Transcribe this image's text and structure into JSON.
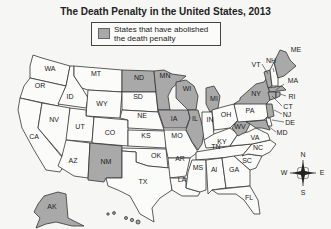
{
  "title": "The Death Penalty in the United States, 2013",
  "legend": {
    "label": "States that have abolished the death penalty",
    "swatch_color": "#a9a9a9"
  },
  "colors": {
    "abolished": "#a9a9a9",
    "retained": "#fbfbfa",
    "border": "#333333"
  },
  "abolished_states": [
    "ND",
    "MN",
    "WI",
    "MI",
    "IA",
    "IL",
    "NM",
    "NY",
    "VT",
    "ME",
    "MA",
    "RI",
    "CT",
    "NJ",
    "WV",
    "MD",
    "AK",
    "HI"
  ],
  "state_labels": {
    "WA": "WA",
    "OR": "OR",
    "CA": "CA",
    "ID": "ID",
    "NV": "NV",
    "MT": "MT",
    "WY": "WY",
    "UT": "UT",
    "AZ": "AZ",
    "CO": "CO",
    "NM": "NM",
    "ND": "ND",
    "SD": "SD",
    "NE": "NE",
    "KS": "KS",
    "OK": "OK",
    "TX": "TX",
    "MN": "MN",
    "IA": "IA",
    "MO": "MO",
    "AR": "AR",
    "LA": "LA",
    "WI": "WI",
    "IL": "IL",
    "MS": "MS",
    "MI": "MI",
    "IN": "IN",
    "KY": "KY",
    "TN": "TN",
    "AL": "Al",
    "OH": "OH",
    "GA": "GA",
    "FL": "FL",
    "SC": "SC",
    "NC": "NC",
    "VA": "VA",
    "WV": "WV",
    "PA": "PA",
    "NY": "NY",
    "VT": "VT",
    "NH": "NH",
    "ME": "ME",
    "MA": "MA",
    "RI": "RI",
    "CT": "CT",
    "NJ": "NJ",
    "DE": "DE",
    "MD": "MD",
    "AK": "AK"
  },
  "compass": {
    "n": "N",
    "s": "S",
    "e": "E",
    "w": "W"
  }
}
